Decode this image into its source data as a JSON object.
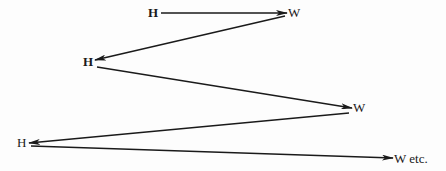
{
  "diagram": {
    "type": "zigzag-flow",
    "nodes": [
      {
        "id": "h1",
        "label": "H",
        "x": 148,
        "y": 6
      },
      {
        "id": "w1",
        "label": "W",
        "x": 288,
        "y": 6
      },
      {
        "id": "h2",
        "label": "H",
        "x": 83,
        "y": 55
      },
      {
        "id": "w2",
        "label": "W",
        "x": 353,
        "y": 101
      },
      {
        "id": "h3",
        "label": "H",
        "x": 17,
        "y": 136
      },
      {
        "id": "w3",
        "label": "W etc.",
        "x": 394,
        "y": 152
      }
    ],
    "edges": [
      {
        "from": "h1",
        "to": "w1"
      },
      {
        "from": "w1",
        "to": "h2"
      },
      {
        "from": "h2",
        "to": "w2"
      },
      {
        "from": "w2",
        "to": "h3"
      },
      {
        "from": "h3",
        "to": "w3"
      }
    ],
    "colors": {
      "line": "#1a1a1a",
      "background": "#fdfdfd"
    }
  }
}
